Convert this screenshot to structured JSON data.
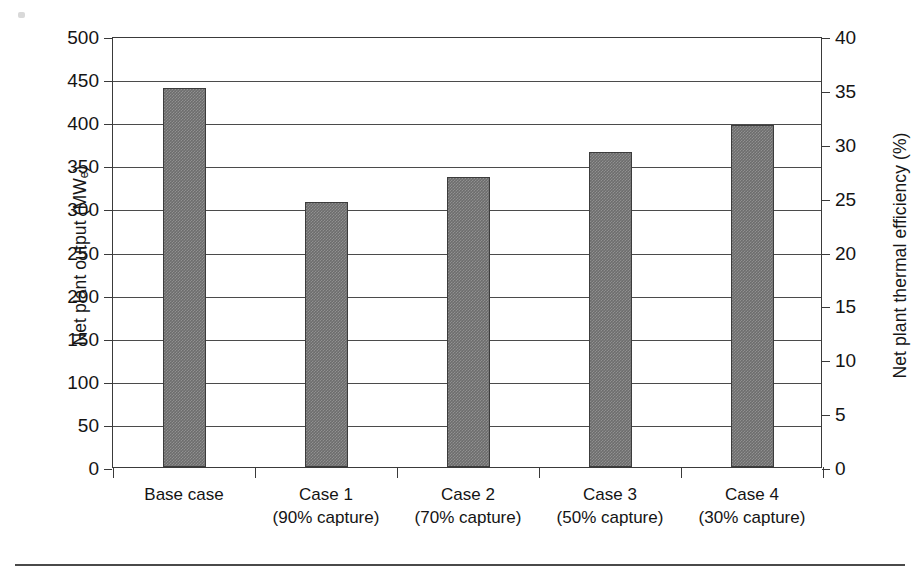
{
  "chart_data": {
    "type": "bar",
    "title": "",
    "subtitle": "",
    "xlabel": "",
    "ylabel": "Net plant output (MWe)",
    "ylabel_secondary": "Net plant thermal efficiency (%)",
    "categories": [
      "Base case",
      "Case 1",
      "Case 2",
      "Case 3",
      "Case 4"
    ],
    "category_sublabels": [
      "",
      "(90% capture)",
      "(70% capture)",
      "(50% capture)",
      "(30% capture)"
    ],
    "values": [
      440,
      307,
      337,
      366,
      397
    ],
    "value_unit": "MWe",
    "ylim": [
      0,
      500
    ],
    "yticks": [
      0,
      50,
      100,
      150,
      200,
      250,
      300,
      350,
      400,
      450,
      500
    ],
    "ylim_secondary": [
      0,
      40
    ],
    "yticks_secondary": [
      0,
      5,
      10,
      15,
      20,
      25,
      30,
      35,
      40
    ],
    "grid": true,
    "legend": "none",
    "bar_color": "#6d6d6d",
    "bar_edge_color": "#3c3c3c",
    "axis_color": "#3a3a3a"
  },
  "axes": {
    "left": {
      "title_main": "Net plant output (MW",
      "title_sub": "e",
      "title_tail": ")",
      "ticks": [
        "500",
        "450",
        "400",
        "350",
        "300",
        "250",
        "200",
        "150",
        "100",
        "50",
        "0"
      ]
    },
    "right": {
      "title": "Net plant thermal efficiency (%)",
      "ticks": [
        "40",
        "35",
        "30",
        "25",
        "20",
        "15",
        "10",
        "5",
        "0"
      ]
    }
  },
  "bars": [
    {
      "label": "Base case",
      "sublabel": "",
      "value": 440
    },
    {
      "label": "Case 1",
      "sublabel": "(90% capture)",
      "value": 307
    },
    {
      "label": "Case 2",
      "sublabel": "(70% capture)",
      "value": 337
    },
    {
      "label": "Case 3",
      "sublabel": "(50% capture)",
      "value": 366
    },
    {
      "label": "Case 4",
      "sublabel": "(30% capture)",
      "value": 397
    }
  ]
}
